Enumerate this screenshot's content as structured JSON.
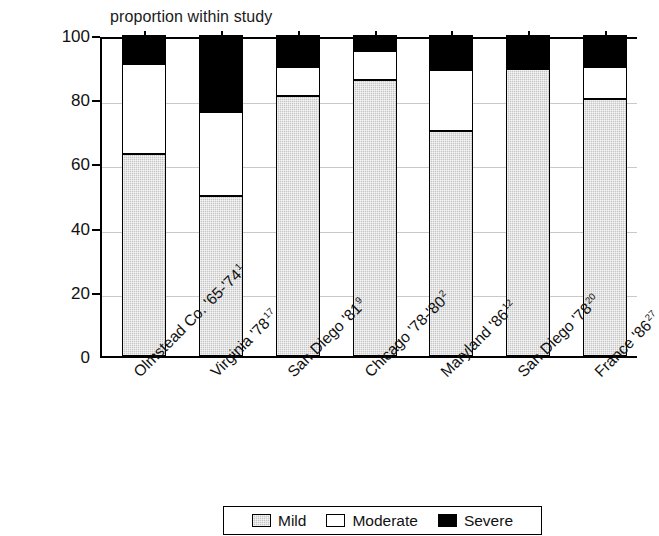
{
  "chart_data": {
    "type": "bar",
    "subtype": "stacked-bar-100",
    "title": "proportion within study",
    "xlabel": "",
    "ylabel": "",
    "ylim": [
      0,
      100
    ],
    "yticks": [
      0,
      20,
      40,
      60,
      80,
      100
    ],
    "ytick_labels": [
      "0",
      "20",
      "40",
      "60",
      "80",
      "100"
    ],
    "grid": true,
    "legend_position": "bottom",
    "categories": [
      "Olmstead Co. '65-'74",
      "Virginia '78",
      "San Diego '81",
      "Chicago '78-'80",
      "Maryland '86",
      "San Diego '78",
      "France '86"
    ],
    "category_superscripts": [
      "1",
      "17",
      "9",
      "2",
      "12",
      "20",
      "27"
    ],
    "series": [
      {
        "name": "Mild",
        "color": "#c6c6c6",
        "values": [
          63,
          50,
          81,
          86,
          70,
          89.5,
          80
        ]
      },
      {
        "name": "Moderate",
        "color": "#ffffff",
        "values": [
          28,
          26,
          9,
          9,
          19,
          0,
          10
        ]
      },
      {
        "name": "Severe",
        "color": "#000000",
        "values": [
          9,
          24,
          10,
          5,
          11,
          10.5,
          10
        ]
      }
    ]
  },
  "legend": {
    "items": [
      {
        "label": "Mild",
        "key": "mild"
      },
      {
        "label": "Moderate",
        "key": "moderate"
      },
      {
        "label": "Severe",
        "key": "severe"
      }
    ]
  }
}
